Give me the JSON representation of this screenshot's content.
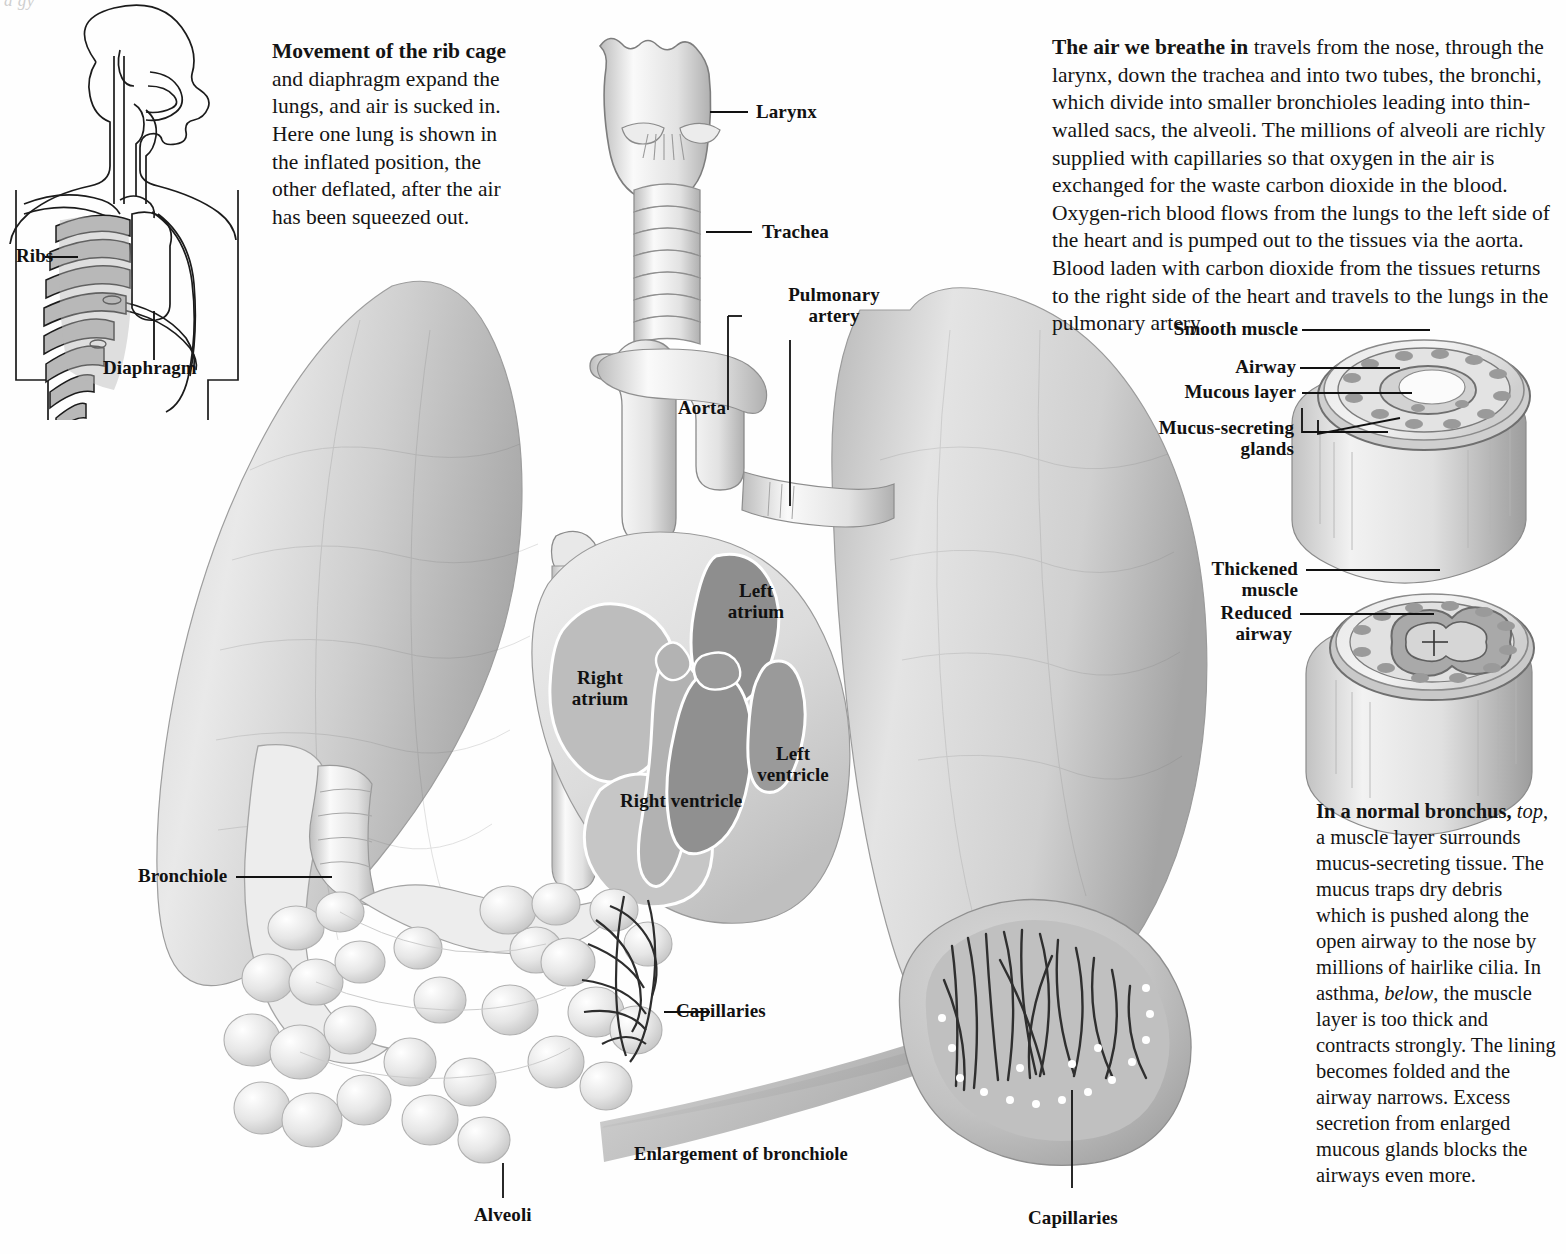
{
  "figure": {
    "top_cut_text": "a gy",
    "rib_caption": {
      "lead": "Movement of the rib cage",
      "rest": "and diaphragm expand the lungs, and air is sucked in. Here one lung is shown in the inflated position, the other deflated, after the air has been squeezed out."
    },
    "breathe_caption": {
      "lead": "The air we breathe in",
      "rest": "travels from the nose, through the larynx, down the trachea and into two tubes, the bronchi, which divide into smaller bronchioles leading into thin-walled sacs, the alveoli. The millions of alveoli are richly supplied with capillaries so that oxygen in the air is exchanged for the waste carbon dioxide in the blood. Oxygen-rich blood flows from the lungs to the left side of the heart and is pumped out to the tissues via the aorta. Blood laden with carbon dioxide from the tissues returns to the right side of the heart and travels to the lungs in the pulmonary artery."
    },
    "bronchus_caption": {
      "lead": "In a normal bronchus,",
      "part1": "top",
      "part2": ", a muscle layer surrounds mucus-secreting tissue. The mucus traps dry debris which is pushed along the open airway to the nose by millions of hairlike cilia. In asthma,",
      "part3": "below",
      "part4": ", the muscle layer is too thick and contracts strongly. The lining becomes folded and the airway narrows. Excess secretion from enlarged mucous glands blocks the airways even more."
    }
  },
  "torso_inset": {
    "ribs_label": "Ribs",
    "diaphragm_label": "Diaphragm"
  },
  "labels": {
    "larynx": "Larynx",
    "trachea": "Trachea",
    "pulmonary_artery_line1": "Pulmonary",
    "pulmonary_artery_line2": "artery",
    "aorta": "Aorta",
    "left_atrium_line1": "Left",
    "left_atrium_line2": "atrium",
    "right_atrium_line1": "Right",
    "right_atrium_line2": "atrium",
    "left_ventricle_line1": "Left",
    "left_ventricle_line2": "ventricle",
    "right_ventricle": "Right ventricle",
    "bronchiole": "Bronchiole",
    "capillaries_left": "Capillaries",
    "alveoli": "Alveoli",
    "enlargement_arrow": "Enlargement of bronchiole",
    "capillaries_right": "Capillaries"
  },
  "bronchus_normal": {
    "smooth_muscle": "Smooth muscle",
    "airway": "Airway",
    "mucous_layer": "Mucous layer",
    "mucus_glands_line1": "Mucus-secreting",
    "mucus_glands_line2": "glands"
  },
  "bronchus_asthma": {
    "thickened_line1": "Thickened",
    "thickened_line2": "muscle",
    "reduced_line1": "Reduced",
    "reduced_line2": "airway"
  },
  "colors": {
    "ink": "#111111",
    "paper": "#fefefe",
    "lung_mid": "#c9c9c9",
    "lung_light": "#e6e6e6",
    "lung_dark": "#a8a8a8",
    "heart_chamber": "#b4b4b4",
    "heart_dark": "#8f8f8f",
    "rib_fill": "#b8b8b8"
  }
}
